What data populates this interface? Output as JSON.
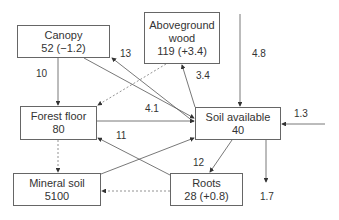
{
  "nodes": {
    "canopy": {
      "name": "Canopy",
      "value": "52 (−1.2)"
    },
    "wood": {
      "name_line1": "Aboveground",
      "name_line2": "wood",
      "value": "119 (+3.4)"
    },
    "forest_floor": {
      "name": "Forest floor",
      "value": "80"
    },
    "soil_available": {
      "name": "Soil available",
      "value": "40"
    },
    "mineral_soil": {
      "name": "Mineral soil",
      "value": "5100"
    },
    "roots": {
      "name": "Roots",
      "value": "28 (+0.8)"
    }
  },
  "flows": {
    "canopy_to_forest_floor": "10",
    "soil_to_canopy": "13",
    "soil_to_wood": "3.4",
    "external_to_soil_top": "4.8",
    "forest_floor_to_soil": "4.1",
    "external_to_soil_right": "1.3",
    "roots_to_forest_floor": "11",
    "soil_to_roots": "12",
    "soil_leaching": "1.7"
  },
  "colors": {
    "line": "#555555",
    "box_border": "#666666",
    "text": "#333333"
  }
}
